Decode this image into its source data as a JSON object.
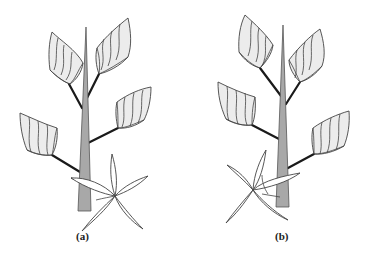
{
  "figure": {
    "panels": [
      {
        "id": "a",
        "label": "(a)",
        "description": "Plant with central tapered stem, four cupped leaves on branches, and a five-petaled star flower at the base overlapping the stem on the right"
      },
      {
        "id": "b",
        "label": "(b)",
        "description": "Mirrored plant arrangement with four cupped leaves and a four/five-petaled star flower at the base overlapping the stem on the left"
      }
    ],
    "colors": {
      "stem": "#a8a8a8",
      "leaf_fill": "#ececec",
      "outline": "#444444",
      "branch": "#1a1a1a",
      "background": "#ffffff"
    }
  }
}
